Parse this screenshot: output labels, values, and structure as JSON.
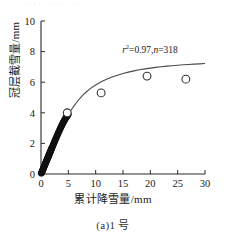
{
  "figure": {
    "top_artifact_text": "· · · · · · · · · · · · · ·",
    "caption": "(a)1 号",
    "annotation_r2_prefix": "r",
    "annotation_r2_sup": "2",
    "annotation_r2_value": "=0.97,",
    "annotation_n_symbol": "n",
    "annotation_n_value": "=318",
    "annotation_full": "r2=0.97,n=318"
  },
  "chart_data": {
    "type": "scatter",
    "title": "",
    "subtitle": "",
    "xlabel": "累计降雪量/mm",
    "ylabel": "冠层截雪量/mm",
    "xlim": [
      0,
      30
    ],
    "ylim": [
      0,
      10
    ],
    "xticks": [
      0,
      5,
      10,
      15,
      20,
      25,
      30
    ],
    "yticks": [
      0,
      2,
      4,
      6,
      8,
      10
    ],
    "xtick_labels": [
      "0",
      "5",
      "10",
      "15",
      "20",
      "25",
      "30"
    ],
    "ytick_labels": [
      "0",
      "2",
      "4",
      "6",
      "8",
      "10"
    ],
    "grid": false,
    "legend": false,
    "legend_position": "none",
    "annotations": [
      {
        "text": "r2=0.97,n=318",
        "x": 17.5,
        "y": 8.1
      }
    ],
    "series": [
      {
        "name": "观测值(密集)",
        "marker": "filled-circle",
        "color": "#111111",
        "points": [
          [
            0.05,
            0.05
          ],
          [
            0.1,
            0.08
          ],
          [
            0.15,
            0.12
          ],
          [
            0.2,
            0.15
          ],
          [
            0.25,
            0.2
          ],
          [
            0.3,
            0.24
          ],
          [
            0.35,
            0.28
          ],
          [
            0.4,
            0.33
          ],
          [
            0.45,
            0.38
          ],
          [
            0.5,
            0.42
          ],
          [
            0.55,
            0.46
          ],
          [
            0.6,
            0.5
          ],
          [
            0.65,
            0.55
          ],
          [
            0.7,
            0.6
          ],
          [
            0.75,
            0.64
          ],
          [
            0.8,
            0.68
          ],
          [
            0.85,
            0.72
          ],
          [
            0.9,
            0.77
          ],
          [
            0.95,
            0.81
          ],
          [
            1.0,
            0.85
          ],
          [
            1.05,
            0.9
          ],
          [
            1.1,
            0.94
          ],
          [
            1.15,
            0.98
          ],
          [
            1.2,
            1.02
          ],
          [
            1.25,
            1.07
          ],
          [
            1.3,
            1.11
          ],
          [
            1.35,
            1.15
          ],
          [
            1.4,
            1.2
          ],
          [
            1.45,
            1.24
          ],
          [
            1.5,
            1.28
          ],
          [
            1.55,
            1.32
          ],
          [
            1.6,
            1.37
          ],
          [
            1.65,
            1.41
          ],
          [
            1.7,
            1.45
          ],
          [
            1.75,
            1.5
          ],
          [
            1.8,
            1.54
          ],
          [
            1.85,
            1.58
          ],
          [
            1.9,
            1.62
          ],
          [
            1.95,
            1.67
          ],
          [
            2.0,
            1.71
          ],
          [
            2.1,
            1.79
          ],
          [
            2.2,
            1.88
          ],
          [
            2.3,
            1.96
          ],
          [
            2.4,
            2.05
          ],
          [
            2.5,
            2.13
          ],
          [
            2.6,
            2.22
          ],
          [
            2.7,
            2.3
          ],
          [
            2.8,
            2.38
          ],
          [
            2.9,
            2.47
          ],
          [
            3.0,
            2.55
          ],
          [
            3.1,
            2.63
          ],
          [
            3.2,
            2.71
          ],
          [
            3.3,
            2.79
          ],
          [
            3.4,
            2.87
          ],
          [
            3.5,
            2.95
          ],
          [
            3.6,
            3.02
          ],
          [
            3.7,
            3.1
          ],
          [
            3.8,
            3.17
          ],
          [
            3.9,
            3.25
          ],
          [
            4.0,
            3.32
          ],
          [
            4.1,
            3.39
          ],
          [
            4.2,
            3.45
          ],
          [
            4.3,
            3.52
          ],
          [
            4.4,
            3.58
          ],
          [
            4.5,
            3.64
          ],
          [
            4.6,
            3.7
          ],
          [
            4.7,
            3.75
          ],
          [
            4.8,
            3.8
          ],
          [
            4.9,
            3.85
          ],
          [
            5.0,
            3.9
          ]
        ]
      },
      {
        "name": "观测值(离散)",
        "marker": "open-circle",
        "color": "#333333",
        "points": [
          [
            4.8,
            4.0
          ],
          [
            11.0,
            5.3
          ],
          [
            19.4,
            6.4
          ],
          [
            26.5,
            6.2
          ]
        ]
      },
      {
        "name": "拟合曲线",
        "marker": "none",
        "type": "line",
        "color": "#4a4a4a",
        "model": "saturating",
        "points": [
          [
            0.0,
            0.0
          ],
          [
            1.0,
            0.8
          ],
          [
            2.0,
            1.64
          ],
          [
            3.0,
            2.45
          ],
          [
            4.0,
            3.2
          ],
          [
            5.0,
            3.88
          ],
          [
            6.0,
            4.44
          ],
          [
            7.0,
            4.9
          ],
          [
            8.0,
            5.28
          ],
          [
            9.0,
            5.58
          ],
          [
            10.0,
            5.82
          ],
          [
            11.0,
            6.03
          ],
          [
            12.0,
            6.2
          ],
          [
            13.0,
            6.34
          ],
          [
            14.0,
            6.46
          ],
          [
            15.0,
            6.57
          ],
          [
            16.0,
            6.66
          ],
          [
            17.0,
            6.74
          ],
          [
            18.0,
            6.81
          ],
          [
            19.0,
            6.87
          ],
          [
            20.0,
            6.92
          ],
          [
            21.0,
            6.97
          ],
          [
            22.0,
            7.01
          ],
          [
            23.0,
            7.05
          ],
          [
            24.0,
            7.08
          ],
          [
            25.0,
            7.11
          ],
          [
            26.0,
            7.14
          ],
          [
            27.0,
            7.16
          ],
          [
            28.0,
            7.18
          ],
          [
            29.0,
            7.2
          ],
          [
            30.0,
            7.22
          ]
        ]
      }
    ]
  }
}
